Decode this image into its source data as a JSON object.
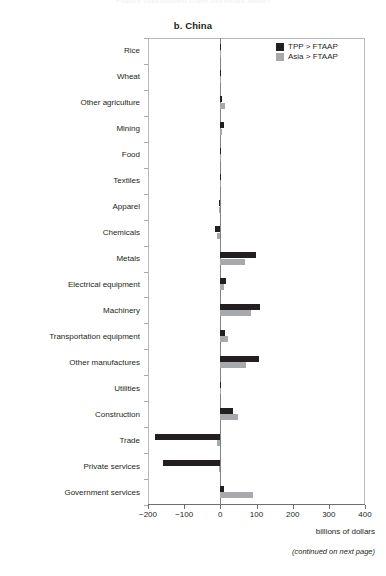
{
  "page": {
    "cut_header": "Figure (continued from previous page)",
    "panel_title": "b. China",
    "footer_note": "(continued on next page)"
  },
  "legend": {
    "items": [
      {
        "label": "TPP > FTAAP",
        "color": "#231f20",
        "key": "tpp"
      },
      {
        "label": "Asia > FTAAP",
        "color": "#a7a9ac",
        "key": "asia"
      }
    ]
  },
  "axis": {
    "x_title": "billions of dollars",
    "x_ticks": [
      "−200",
      "−100",
      "0",
      "100",
      "200",
      "300",
      "400"
    ]
  },
  "chart_data": {
    "type": "bar",
    "orientation": "horizontal",
    "title": "b. China",
    "xlabel": "billions of dollars",
    "ylabel": "",
    "xlim": [
      -200,
      400
    ],
    "xticks": [
      -200,
      -100,
      0,
      100,
      200,
      300,
      400
    ],
    "grid": false,
    "legend_position": "top-right",
    "categories": [
      "Rice",
      "Wheat",
      "Other agriculture",
      "Mining",
      "Food",
      "Textiles",
      "Apparel",
      "Chemicals",
      "Metals",
      "Electrical equipment",
      "Machinery",
      "Transportation equipment",
      "Other manufactures",
      "Utilities",
      "Construction",
      "Trade",
      "Private services",
      "Government services"
    ],
    "series": [
      {
        "name": "TPP > FTAAP",
        "color": "#231f20",
        "values": [
          0,
          0,
          6,
          11,
          1,
          0,
          -3,
          -14,
          100,
          17,
          110,
          14,
          108,
          2,
          36,
          -182,
          -158,
          10
        ]
      },
      {
        "name": "Asia > FTAAP",
        "color": "#a7a9ac",
        "values": [
          2,
          0,
          14,
          4,
          1,
          0,
          -4,
          -10,
          68,
          9,
          85,
          22,
          70,
          1,
          50,
          -10,
          -4,
          90
        ]
      }
    ]
  }
}
